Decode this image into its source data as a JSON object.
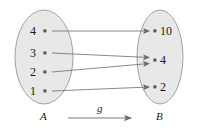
{
  "diagram": {
    "type": "function-mapping-diagram",
    "map_label": "g",
    "colors": {
      "ellipse_fill": "#e8e8e8",
      "ellipse_stroke": "#9a9a9a",
      "arrow": "#6b6b6b",
      "dot": "#555555",
      "text": "#1a1a1a"
    },
    "domain_set": {
      "name": "A",
      "elements": [
        {
          "label": "4",
          "x": 45,
          "y": 31
        },
        {
          "label": "3",
          "x": 45,
          "y": 53
        },
        {
          "label": "2",
          "x": 45,
          "y": 72
        },
        {
          "label": "1",
          "x": 45,
          "y": 91
        }
      ]
    },
    "codomain_set": {
      "name": "B",
      "elements": [
        {
          "label": "10",
          "x": 155,
          "y": 31
        },
        {
          "label": "4",
          "x": 155,
          "y": 60
        },
        {
          "label": "2",
          "x": 155,
          "y": 87
        }
      ]
    },
    "arrows": [
      {
        "from": "4",
        "to": "10",
        "x1": 52,
        "y1": 31,
        "x2": 149,
        "y2": 31
      },
      {
        "from": "3",
        "to": "4",
        "x1": 52,
        "y1": 53,
        "x2": 149,
        "y2": 57
      },
      {
        "from": "2",
        "to": "4",
        "x1": 52,
        "y1": 72,
        "x2": 149,
        "y2": 63
      },
      {
        "from": "1",
        "to": "2",
        "x1": 52,
        "y1": 91,
        "x2": 149,
        "y2": 87
      }
    ]
  }
}
